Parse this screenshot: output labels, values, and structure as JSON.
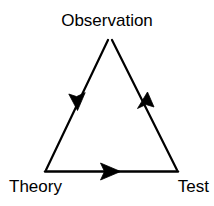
{
  "diagram": {
    "kind": "scientific-method-cycle",
    "background_color": "#ffffff",
    "stroke_color": "#000000",
    "stroke_width": 2,
    "nodes": [
      {
        "id": "observation",
        "label": "Observation",
        "x": 110,
        "y": 36
      },
      {
        "id": "theory",
        "label": "Theory",
        "x": 45,
        "y": 172
      },
      {
        "id": "test",
        "label": "Test",
        "x": 178,
        "y": 172
      }
    ],
    "edges": [
      {
        "id": "observation-to-theory",
        "from": "observation",
        "to": "theory",
        "arrow_direction": "down-left",
        "arrow_tip": {
          "x": 77,
          "y": 105
        }
      },
      {
        "id": "theory-to-test",
        "from": "theory",
        "to": "test",
        "arrow_direction": "right",
        "arrow_tip": {
          "x": 118,
          "y": 172
        }
      },
      {
        "id": "test-to-observation",
        "from": "test",
        "to": "observation",
        "arrow_direction": "up-right",
        "arrow_tip": {
          "x": 147,
          "y": 97
        }
      }
    ]
  }
}
